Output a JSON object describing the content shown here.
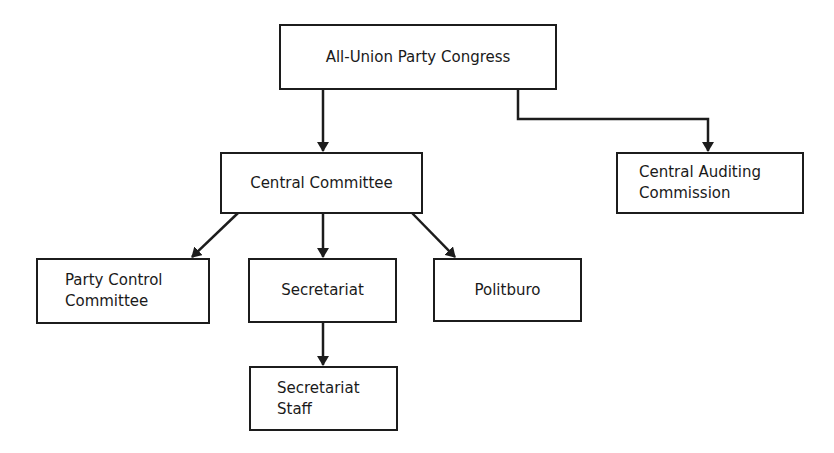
{
  "diagram": {
    "type": "org-chart",
    "nodes": {
      "congress": {
        "lines": [
          "All-Union Party Congress"
        ]
      },
      "central_committee": {
        "lines": [
          "Central Committee"
        ]
      },
      "auditing": {
        "lines": [
          "Central Auditing",
          "Commission"
        ]
      },
      "party_control": {
        "lines": [
          "Party Control",
          "Committee"
        ]
      },
      "secretariat": {
        "lines": [
          "Secretariat"
        ]
      },
      "politburo": {
        "lines": [
          "Politburo"
        ]
      },
      "secretariat_staff": {
        "lines": [
          "Secretariat",
          "Staff"
        ]
      }
    },
    "edges": [
      {
        "from": "All-Union Party Congress",
        "to": "Central Committee"
      },
      {
        "from": "All-Union Party Congress",
        "to": "Central Auditing Commission"
      },
      {
        "from": "Central Committee",
        "to": "Party Control Committee"
      },
      {
        "from": "Central Committee",
        "to": "Secretariat"
      },
      {
        "from": "Central Committee",
        "to": "Politburo"
      },
      {
        "from": "Secretariat",
        "to": "Secretariat Staff"
      }
    ],
    "colors": {
      "line": "#1c1c1c",
      "background": "#ffffff"
    }
  }
}
